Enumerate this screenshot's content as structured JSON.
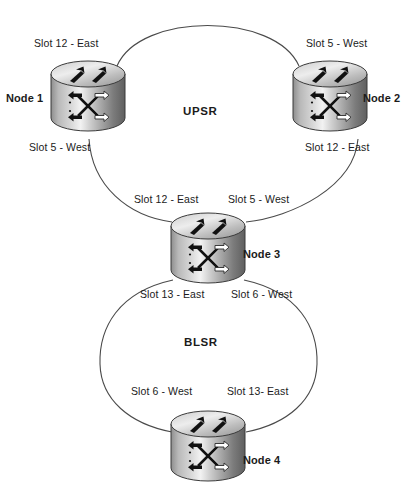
{
  "diagram": {
    "background_color": "#ffffff",
    "line_color": "#4a4a4a",
    "text_color": "#1b1b1b"
  },
  "rings": [
    {
      "id": "upsr",
      "label": "UPSR",
      "label_x": 183,
      "label_y": 112
    },
    {
      "id": "blsr",
      "label": "BLSR",
      "label_x": 184,
      "label_y": 343
    }
  ],
  "nodes": [
    {
      "id": "node1",
      "label": "Node 1",
      "label_x": 6,
      "label_y": 92,
      "icon_x": 48,
      "icon_y": 58,
      "icon_w": 78,
      "icon_h": 80,
      "icon_name": "multilayer-switch-icon",
      "ports": [
        {
          "text": "Slot 12 - East",
          "x": 34,
          "y": 37
        },
        {
          "text": "Slot 5 - West",
          "x": 29,
          "y": 141
        }
      ]
    },
    {
      "id": "node2",
      "label": "Node 2",
      "label_x": 363,
      "label_y": 92,
      "icon_x": 290,
      "icon_y": 58,
      "icon_w": 78,
      "icon_h": 80,
      "icon_name": "multilayer-switch-icon",
      "ports": [
        {
          "text": "Slot 5 - West",
          "x": 306,
          "y": 37
        },
        {
          "text": "Slot 12 - East",
          "x": 305,
          "y": 141
        }
      ]
    },
    {
      "id": "node3",
      "label": "Node 3",
      "label_x": 243,
      "label_y": 248,
      "icon_x": 168,
      "icon_y": 210,
      "icon_w": 80,
      "icon_h": 80,
      "icon_name": "multilayer-switch-icon",
      "ports": [
        {
          "text": "Slot 12 - East",
          "x": 134,
          "y": 193
        },
        {
          "text": "Slot 5 - West",
          "x": 228,
          "y": 193
        },
        {
          "text": "Slot 13 - East",
          "x": 140,
          "y": 288
        },
        {
          "text": "Slot 6 - West",
          "x": 231,
          "y": 288
        }
      ]
    },
    {
      "id": "node4",
      "label": "Node 4",
      "label_x": 243,
      "label_y": 454,
      "icon_x": 168,
      "icon_y": 408,
      "icon_w": 80,
      "icon_h": 80,
      "icon_name": "multilayer-switch-icon",
      "ports": [
        {
          "text": "Slot 6 - West",
          "x": 131,
          "y": 385
        },
        {
          "text": "Slot 13- East",
          "x": 227,
          "y": 385
        }
      ]
    }
  ]
}
